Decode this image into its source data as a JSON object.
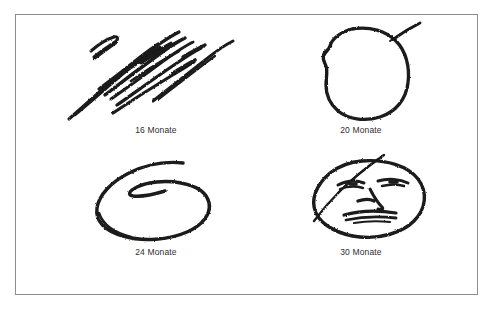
{
  "figure": {
    "background_color": "#ffffff",
    "frame_border_color": "#8d8d8d",
    "ink_color": "#1a1a1a",
    "caption_color": "#2e2e2e"
  },
  "panels": [
    {
      "id": "panel-16",
      "caption": "16 Monate",
      "drawing_name": "scribble-diagonal-strokes",
      "description": "Bundle of roughly parallel diagonal crayon scribble strokes running from lower-left to upper-right"
    },
    {
      "id": "panel-20",
      "caption": "20 Monate",
      "drawing_name": "closed-blob-outline",
      "description": "Single closed irregular rounded outline with a notch on the left side and a short tail stroke at the upper right"
    },
    {
      "id": "panel-24",
      "caption": "24 Monate",
      "drawing_name": "spiral-oval",
      "description": "Oval outline drawn as a spiral, the stroke curling once inside the shape"
    },
    {
      "id": "panel-30",
      "caption": "30 Monate",
      "drawing_name": "face-with-features",
      "description": "Oval head outline containing two eyes, a nose and a mouth, with a stray hair stroke at the upper left"
    }
  ]
}
